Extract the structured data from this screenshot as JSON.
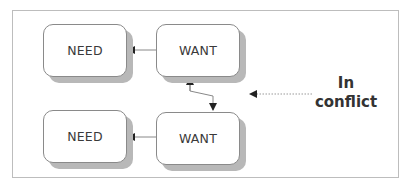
{
  "diagram": {
    "nodes": [
      {
        "id": "need-top",
        "label": "NEED"
      },
      {
        "id": "want-top",
        "label": "WANT"
      },
      {
        "id": "need-bottom",
        "label": "NEED"
      },
      {
        "id": "want-bottom",
        "label": "WANT"
      }
    ],
    "edges": [
      {
        "from": "want-top",
        "to": "need-top",
        "style": "solid"
      },
      {
        "from": "want-bottom",
        "to": "need-bottom",
        "style": "solid"
      },
      {
        "from": "want-top",
        "to": "want-bottom",
        "style": "solid",
        "bidirectional": true
      }
    ],
    "annotation": {
      "line1": "In",
      "line2": "conflict",
      "points_to": "want-top/want-bottom connector",
      "arrow_style": "dotted"
    },
    "colors": {
      "border": "#8a8a8a",
      "shadow": "#b8b8b8",
      "frame": "#bdbdbd",
      "text": "#333333"
    }
  }
}
